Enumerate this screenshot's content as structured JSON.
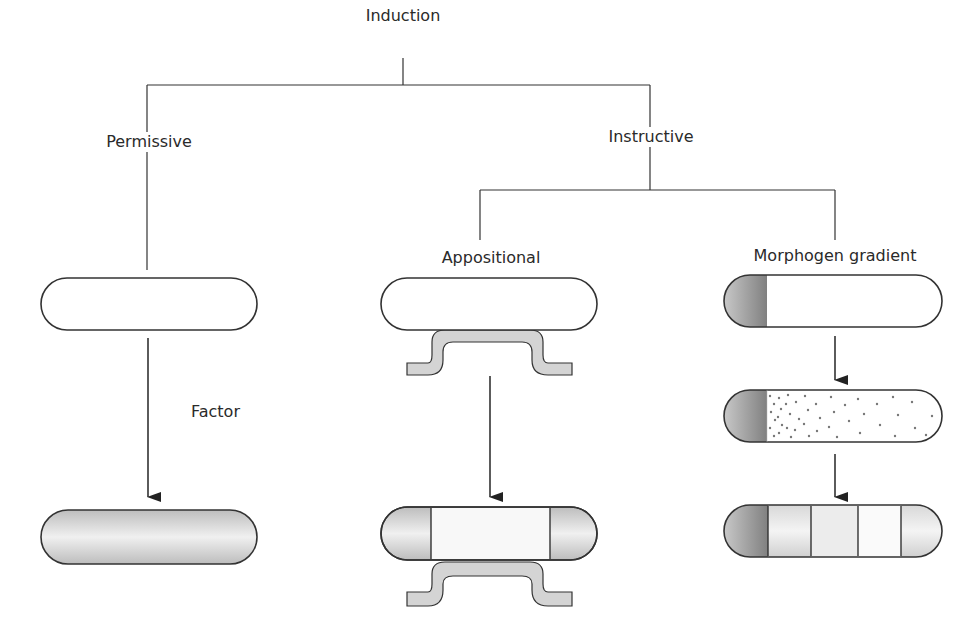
{
  "title": "Induction",
  "branches": {
    "permissive": {
      "label": "Permissive",
      "arrow_label": "Factor"
    },
    "instructive": {
      "label": "Instructive",
      "subtypes": [
        {
          "label": "Appositional"
        },
        {
          "label": "Morphogen gradient"
        }
      ]
    }
  },
  "colors": {
    "line": "#333333",
    "shade_dark": "#8a8a8a",
    "shade_light": "#e6e6e6",
    "dot": "#777777"
  }
}
